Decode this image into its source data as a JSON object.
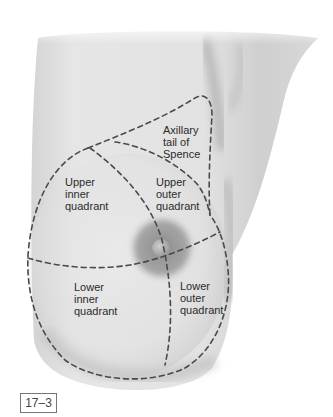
{
  "figure": {
    "number": "17–3"
  },
  "labels": {
    "axillary_tail": "Axillary\ntail of\nSpence",
    "upper_inner": "Upper\ninner\nquadrant",
    "upper_outer": "Upper\nouter\nquadrant",
    "lower_inner": "Lower\ninner\nquadrant",
    "lower_outer": "Lower\nouter\nquadrant"
  },
  "colors": {
    "skin_light": "#e8e8e8",
    "skin_shadow": "#b5b5b5",
    "areola": "#9a9a9a",
    "dash_line": "#4a4a4a",
    "label_text": "#2b2b2b"
  }
}
